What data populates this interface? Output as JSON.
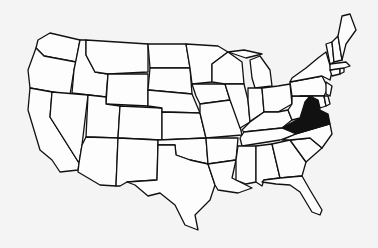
{
  "map": {
    "title": "United States map",
    "highlighted_state": "Virginia",
    "highlight_color": "#111111",
    "fill_color": "#fdfdfd",
    "background_color": "#f4f4f4",
    "states": [
      "WA",
      "OR",
      "CA",
      "ID",
      "NV",
      "MT",
      "WY",
      "UT",
      "AZ",
      "CO",
      "NM",
      "ND",
      "SD",
      "NE",
      "KS",
      "OK",
      "TX",
      "MN",
      "IA",
      "MO",
      "AR",
      "LA",
      "WI",
      "IL",
      "MI",
      "IN",
      "OH",
      "KY",
      "TN",
      "MS",
      "AL",
      "GA",
      "FL",
      "SC",
      "NC",
      "VA",
      "WV",
      "PA",
      "NY",
      "MD",
      "DE",
      "NJ",
      "CT",
      "RI",
      "MA",
      "VT",
      "NH",
      "ME"
    ]
  }
}
